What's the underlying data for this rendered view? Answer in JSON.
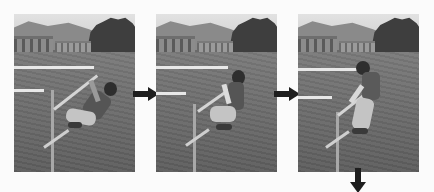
{
  "figure": {
    "colors": {
      "background": "#fbfbfb",
      "arrow": "#1e1e1e",
      "grass": "#6a6a6a"
    },
    "frames": [
      {
        "step": 1,
        "pose": "leaning back, hanging below bar"
      },
      {
        "step": 2,
        "pose": "crouched, pulling toward bar"
      },
      {
        "step": 3,
        "pose": "rising to standing beside bar"
      }
    ],
    "arrows": [
      {
        "direction": "right",
        "from": 1,
        "to": 2
      },
      {
        "direction": "right",
        "from": 2,
        "to": 3
      },
      {
        "direction": "down",
        "from": 3,
        "to": "next"
      }
    ]
  }
}
